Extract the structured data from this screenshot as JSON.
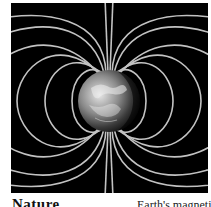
{
  "figure": {
    "background_color": "#000000",
    "field_line_color": "#d8d8d8",
    "earth_highlight_color": "#cfcfcf",
    "earth_shadow_color": "#111111"
  },
  "caption": {
    "title": "Nature",
    "subtitle": "Earth's magnetic"
  }
}
